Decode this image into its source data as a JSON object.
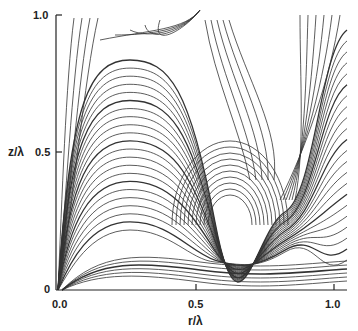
{
  "chart_data": {
    "type": "line",
    "title": "",
    "subtitle": "Streamline pattern (flow field) in the r–z plane",
    "xlabel": "r/λ",
    "ylabel": "z/λ",
    "xlim": [
      0.0,
      1.05
    ],
    "ylim": [
      0.0,
      1.0
    ],
    "x_ticks": [
      "0.0",
      "0.5",
      "1.0"
    ],
    "y_ticks": [
      "0",
      "0.5",
      "1.0"
    ],
    "grid": false,
    "legend": null,
    "annotations": [],
    "features": {
      "vortex_center_approx": {
        "r": 0.65,
        "z": 0.27
      },
      "saddle_region_approx": {
        "r": 0.5,
        "z": 0.95
      },
      "description": "Curved streamlines with arrowheads; lines arch from origin region, dip around an empty oval near r≈0.65, z≈0.27, and flatten toward larger r at low z."
    },
    "colors": {
      "line": "#333333",
      "axis": "#222222",
      "background": "#ffffff"
    }
  },
  "axes": {
    "x_label": "r/λ",
    "y_label": "z/λ",
    "x_ticks": [
      "0.0",
      "0.5",
      "1.0"
    ],
    "y_ticks": [
      "0",
      "0.5",
      "1.0"
    ]
  }
}
